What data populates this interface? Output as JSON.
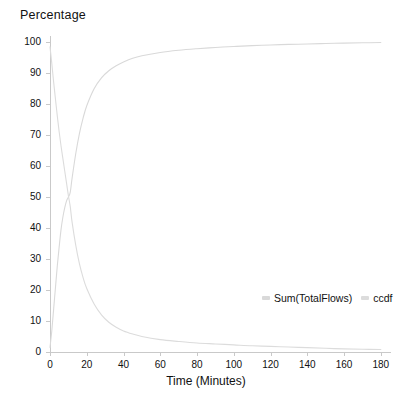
{
  "chart_data": {
    "type": "line",
    "title": "Percentage",
    "xlabel": "Time (Minutes)",
    "ylabel": "",
    "xlim": [
      0,
      185
    ],
    "ylim": [
      0,
      102
    ],
    "grid": false,
    "legend_position": "inside-bottom-right",
    "x_ticks": [
      0,
      20,
      40,
      60,
      80,
      100,
      120,
      140,
      160,
      180
    ],
    "y_ticks": [
      0,
      10,
      20,
      30,
      40,
      50,
      60,
      70,
      80,
      90,
      100
    ],
    "crossover": {
      "x": 11,
      "y": 50
    },
    "series": [
      {
        "name": "Sum(TotalFlows)",
        "color": "#d9d9d9",
        "x": [
          0,
          1,
          2,
          3,
          4,
          5,
          6,
          7,
          8,
          9,
          10,
          11,
          12,
          14,
          16,
          18,
          20,
          24,
          28,
          32,
          36,
          40,
          45,
          50,
          60,
          70,
          80,
          90,
          100,
          110,
          120,
          130,
          140,
          150,
          160,
          170,
          180
        ],
        "values": [
          1.5,
          7.0,
          14.0,
          21.0,
          28.0,
          34.0,
          39.5,
          43.5,
          46.5,
          48.8,
          50.0,
          51.5,
          56.0,
          64.0,
          70.5,
          75.5,
          79.5,
          85.0,
          88.5,
          90.8,
          92.4,
          93.6,
          94.8,
          95.6,
          96.7,
          97.4,
          97.9,
          98.3,
          98.6,
          98.9,
          99.1,
          99.3,
          99.4,
          99.6,
          99.7,
          99.8,
          99.9
        ]
      },
      {
        "name": "ccdf",
        "color": "#dcdcdc",
        "x": [
          0,
          1,
          2,
          3,
          4,
          5,
          6,
          7,
          8,
          9,
          10,
          11,
          12,
          14,
          16,
          18,
          20,
          24,
          28,
          32,
          36,
          40,
          45,
          50,
          60,
          70,
          80,
          90,
          100,
          110,
          120,
          130,
          140,
          150,
          160,
          170,
          180
        ],
        "values": [
          98.5,
          93.0,
          87.0,
          81.5,
          76.0,
          71.0,
          66.5,
          62.5,
          58.5,
          54.5,
          50.5,
          47.0,
          42.0,
          34.5,
          28.5,
          24.0,
          20.5,
          15.5,
          12.0,
          9.6,
          8.0,
          6.8,
          5.8,
          5.0,
          4.0,
          3.4,
          2.9,
          2.6,
          2.3,
          2.0,
          1.8,
          1.6,
          1.4,
          1.2,
          1.0,
          0.9,
          0.8
        ]
      }
    ]
  },
  "legend": {
    "entries": [
      {
        "label": "Sum(TotalFlows)",
        "color": "#d9d9d9"
      },
      {
        "label": "ccdf",
        "color": "#dcdcdc"
      }
    ]
  },
  "axes": {
    "x_tick_labels": [
      "0",
      "20",
      "40",
      "60",
      "80",
      "100",
      "120",
      "140",
      "160",
      "180"
    ],
    "y_tick_labels": [
      "0",
      "10",
      "20",
      "30",
      "40",
      "50",
      "60",
      "70",
      "80",
      "90",
      "100"
    ],
    "axis_color": "#c9c9c9"
  }
}
